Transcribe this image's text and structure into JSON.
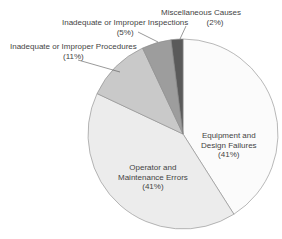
{
  "chart_data": {
    "type": "pie",
    "title": "",
    "start_angle_deg": 0,
    "direction": "clockwise",
    "slices": [
      {
        "label": "Equipment and Design Failures",
        "display": [
          "Equipment and",
          "Design Failures",
          "(41%)"
        ],
        "value": 41,
        "color": "#fbfbfb"
      },
      {
        "label": "Operator and Maintenance Errors",
        "display": [
          "Operator and",
          "Maintenance Errors",
          "(41%)"
        ],
        "value": 41,
        "color": "#ececec"
      },
      {
        "label": "Inadequate or Improper Procedures",
        "display": [
          "Inadequate or Improper Procedures",
          "(11%)"
        ],
        "value": 11,
        "color": "#c9c9c9"
      },
      {
        "label": "Inadequate or Improper Inspections",
        "display": [
          "Inadequate or Improper Inspections",
          "(5%)"
        ],
        "value": 5,
        "color": "#9d9d9d"
      },
      {
        "label": "Miscellaneous Causes",
        "display": [
          "Miscellaneous Causes",
          "(2%)"
        ],
        "value": 2,
        "color": "#5a5a5a"
      }
    ],
    "legend": "none (labels placed on/near slices)"
  }
}
